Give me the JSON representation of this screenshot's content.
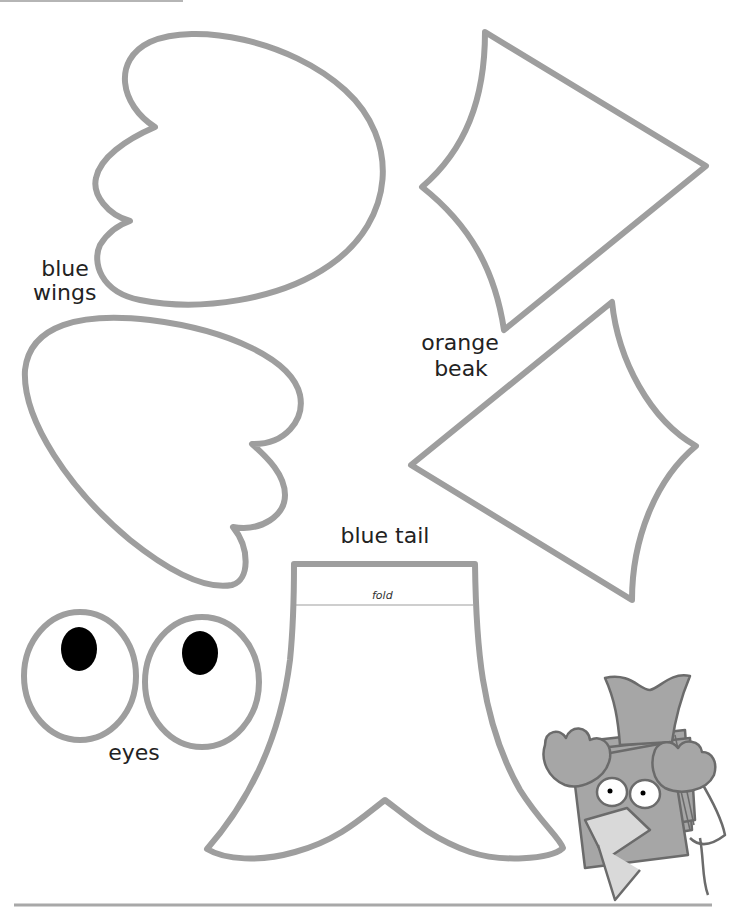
{
  "colors": {
    "outline": "#9e9e9e",
    "text": "#222222",
    "pupil": "#000000",
    "character_fill": "#a6a6a6",
    "character_light": "#d9d9d9",
    "character_stroke": "#6b6b6b"
  },
  "pieces": [
    {
      "id": "wing-upper",
      "label": "blue wings"
    },
    {
      "id": "wing-lower",
      "label": ""
    },
    {
      "id": "beak-upper",
      "label": "orange beak"
    },
    {
      "id": "beak-lower",
      "label": ""
    },
    {
      "id": "tail",
      "label": "blue tail"
    },
    {
      "id": "eye-left",
      "label": "eyes"
    },
    {
      "id": "eye-right",
      "label": ""
    }
  ],
  "labels": {
    "wings_line1": "blue",
    "wings_line2": "wings",
    "beak_line1": "orange",
    "beak_line2": "beak",
    "tail": "blue tail",
    "fold": "fold",
    "eyes": "eyes"
  }
}
